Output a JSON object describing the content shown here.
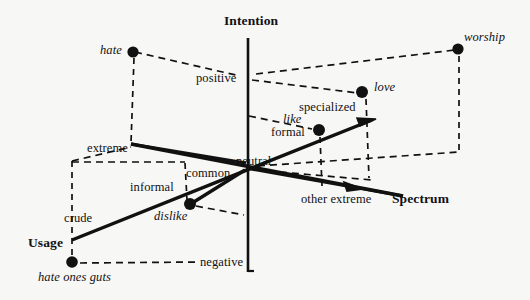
{
  "figure": {
    "background_color": "#f7f7f6",
    "ink_color": "#111111",
    "axes": [
      {
        "id": "intention",
        "label": "Intention",
        "x": 250,
        "y": 16,
        "orientation": "vertical"
      },
      {
        "id": "spectrum",
        "label": "Spectrum",
        "x": 392,
        "y": 193,
        "orientation": "diagonal-down-right"
      },
      {
        "id": "usage",
        "label": "Usage",
        "x": 28,
        "y": 236,
        "orientation": "diagonal-up-right"
      }
    ],
    "scale_labels": [
      {
        "id": "positive",
        "label": "positive",
        "x": 196,
        "y": 73
      },
      {
        "id": "neutral",
        "label": "neutral",
        "x": 236,
        "y": 155
      },
      {
        "id": "negative",
        "label": "negative",
        "x": 200,
        "y": 256
      },
      {
        "id": "extreme",
        "label": "extreme",
        "x": 88,
        "y": 142
      },
      {
        "id": "common",
        "label": "common",
        "x": 186,
        "y": 167
      },
      {
        "id": "other-extreme",
        "label": "other extreme",
        "x": 301,
        "y": 193
      },
      {
        "id": "crude",
        "label": "crude",
        "x": 64,
        "y": 212
      },
      {
        "id": "informal",
        "label": "informal",
        "x": 130,
        "y": 181
      },
      {
        "id": "formal",
        "label": "formal",
        "x": 272,
        "y": 126
      },
      {
        "id": "specialized",
        "label": "specialized",
        "x": 300,
        "y": 101
      }
    ],
    "terms": [
      {
        "id": "hate",
        "label": "hate",
        "label_x": 100,
        "label_y": 44,
        "dot_x": 133,
        "dot_y": 52
      },
      {
        "id": "worship",
        "label": "worship",
        "label_x": 464,
        "label_y": 32,
        "dot_x": 458,
        "dot_y": 49
      },
      {
        "id": "love",
        "label": "love",
        "label_x": 374,
        "label_y": 82,
        "dot_x": 362,
        "dot_y": 92
      },
      {
        "id": "like",
        "label": "like",
        "label_x": 283,
        "label_y": 114,
        "dot_x": 319,
        "dot_y": 130
      },
      {
        "id": "dislike",
        "label": "dislike",
        "label_x": 155,
        "label_y": 210,
        "dot_x": 190,
        "dot_y": 204
      },
      {
        "id": "hate-ones-guts",
        "label": "hate ones guts",
        "label_x": 40,
        "label_y": 272,
        "dot_x": 72,
        "dot_y": 262
      }
    ]
  }
}
